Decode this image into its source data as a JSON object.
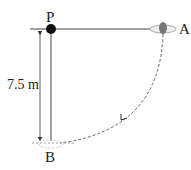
{
  "diagram": {
    "labels": {
      "pivot": "P",
      "start": "A",
      "bottom": "B",
      "length": "7.5 m"
    },
    "colors": {
      "line": "#333333",
      "dashed": "#555555",
      "bob": "#777777",
      "pivot": "#111111"
    }
  }
}
